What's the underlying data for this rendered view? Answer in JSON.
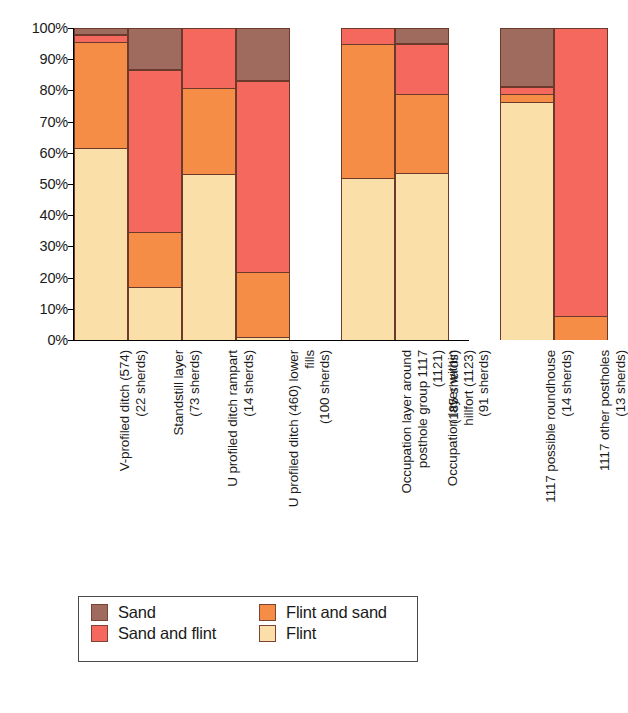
{
  "chart_data": {
    "type": "bar",
    "subtype": "stacked-percentage",
    "title": "",
    "xlabel": "",
    "ylabel": "",
    "ylim": [
      0,
      100
    ],
    "y_unit": "%",
    "grid": false,
    "legend_position": "bottom",
    "y_ticks": [
      "0%",
      "10%",
      "20%",
      "30%",
      "40%",
      "50%",
      "60%",
      "70%",
      "80%",
      "90%",
      "100%"
    ],
    "categories": [
      "V-profiled ditch (574) (22 sherds)",
      "Standstill layer (73 sherds)",
      "U profiled ditch rampart (14 sherds)",
      "U profiled ditch (460) lower fills (100 sherds)",
      "Occupation layer around posthole group 1117 (1121) (185 sherds)",
      "Occupation layer within hillfort (1123) (91 sherds)",
      "1117 possible roundhouse (14 sherds)",
      "1117 other postholes (13 sherds)"
    ],
    "category_lines": [
      [
        "V-profiled ditch (574)",
        "(22 sherds)"
      ],
      [
        "Standstill layer",
        "(73 sherds)"
      ],
      [
        "U profiled ditch rampart",
        "(14 sherds)"
      ],
      [
        "U profiled ditch (460) lower",
        "fills",
        "(100 sherds)"
      ],
      [
        "Occupation layer around",
        "posthole group 1117",
        "(1121)",
        "(185 sherds)"
      ],
      [
        "Occupation layer within",
        "hillfort (1123)",
        "(91 sherds)"
      ],
      [
        "1117 possible roundhouse",
        "(14 sherds)"
      ],
      [
        "1117 other postholes",
        "(13 sherds)"
      ]
    ],
    "series": [
      {
        "name": "Flint",
        "color": "#fbdfa8",
        "values": [
          61.4,
          16.9,
          53.2,
          1.0,
          51.9,
          53.6,
          76.4,
          0.0
        ]
      },
      {
        "name": "Flint and sand",
        "color": "#f58d46",
        "values": [
          34.1,
          17.6,
          27.7,
          20.9,
          43.1,
          25.3,
          2.6,
          7.7
        ]
      },
      {
        "name": "Sand and flint",
        "color": "#f4685e",
        "values": [
          2.3,
          52.0,
          19.1,
          61.2,
          5.0,
          16.0,
          2.2,
          92.3
        ]
      },
      {
        "name": "Sand",
        "color": "#9e6b5e",
        "values": [
          2.2,
          13.5,
          0.0,
          16.9,
          0.0,
          5.1,
          18.8,
          0.0
        ]
      }
    ]
  },
  "legend": {
    "items": [
      {
        "label": "Sand",
        "color": "#9e6b5e"
      },
      {
        "label": "Flint and sand",
        "color": "#f58d46"
      },
      {
        "label": "Sand and flint",
        "color": "#f4685e"
      },
      {
        "label": "Flint",
        "color": "#fbdfa8"
      }
    ]
  },
  "caption": {
    "text": ""
  }
}
